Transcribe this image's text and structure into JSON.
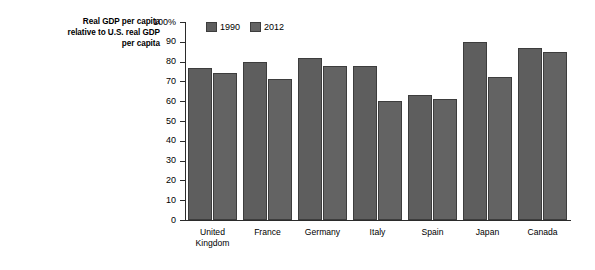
{
  "chart_data": {
    "type": "bar",
    "title": "Real GDP per capita relative to U.S. real GDP per capita",
    "title_lines": [
      "Real GDP per capita",
      "relative to U.S. real GDP",
      "per capita"
    ],
    "xlabel": "",
    "ylabel": "",
    "ylim": [
      0,
      100
    ],
    "grid": false,
    "legend_position": "top-left",
    "y_ticks": [
      "0",
      "10",
      "20",
      "30",
      "40",
      "50",
      "60",
      "70",
      "80",
      "90",
      "100%"
    ],
    "y_tick_values": [
      0,
      10,
      20,
      30,
      40,
      50,
      60,
      70,
      80,
      90,
      100
    ],
    "categories": [
      "United Kingdom",
      "France",
      "Germany",
      "Italy",
      "Spain",
      "Japan",
      "Canada"
    ],
    "category_lines": [
      [
        "United",
        "Kingdom"
      ],
      [
        "France"
      ],
      [
        "Germany"
      ],
      [
        "Italy"
      ],
      [
        "Spain"
      ],
      [
        "Japan"
      ],
      [
        "Canada"
      ]
    ],
    "series": [
      {
        "name": "1990",
        "color": "#5e5e5e",
        "values": [
          77,
          80,
          82,
          78,
          63,
          90,
          87
        ]
      },
      {
        "name": "2012",
        "color": "#636363",
        "values": [
          74,
          71,
          78,
          60,
          61,
          72,
          85
        ]
      }
    ]
  },
  "legend": {
    "entries": [
      {
        "label": "1990"
      },
      {
        "label": "2012"
      }
    ]
  }
}
